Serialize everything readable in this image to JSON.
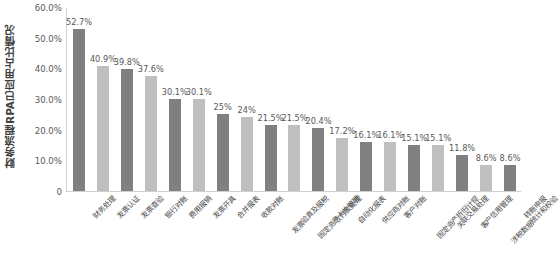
{
  "chart_data": {
    "type": "bar",
    "title": "",
    "subtitle": "",
    "xlabel": "",
    "ylabel": "财务流程RPA已应用占比情况",
    "ylim": [
      0,
      60
    ],
    "ytick_labels": [
      "0",
      "10.0%",
      "20.0%",
      "30.0%",
      "40.0%",
      "50.0%",
      "60.0%"
    ],
    "ytick_values": [
      0,
      10,
      20,
      30,
      40,
      50,
      60
    ],
    "grid": false,
    "legend": false,
    "legend_position": "none",
    "bar_colors": [
      "#808080",
      "#bfbfbf"
    ],
    "categories": [
      "财务处理",
      "发票认证",
      "发票查验",
      "银行对账",
      "费用报销",
      "发票开具",
      "合并报表",
      "收款对账",
      "发票验真及报税",
      "固定资产卡片管理",
      "收付款处理",
      "自动化报表",
      "供应商对账",
      "客户对账",
      "固定资产折旧计提",
      "关联交易处理",
      "客户信用管理",
      "涉税数据统计和校验",
      "转账申报"
    ],
    "values": [
      52.7,
      40.9,
      39.8,
      37.6,
      30.1,
      30.1,
      25,
      24,
      21.5,
      21.5,
      20.4,
      17.2,
      16.1,
      16.1,
      15.1,
      15.1,
      11.8,
      8.6,
      8.6
    ],
    "value_labels": [
      "52.7%",
      "40.9%",
      "39.8%",
      "37.6%",
      "30.1%",
      "30.1%",
      "25%",
      "24%",
      "21.5%",
      "21.5%",
      "20.4%",
      "17.2%",
      "16.1%",
      "16.1%",
      "15.1%",
      "15.1%",
      "11.8%",
      "8.6%",
      "8.6%"
    ]
  }
}
